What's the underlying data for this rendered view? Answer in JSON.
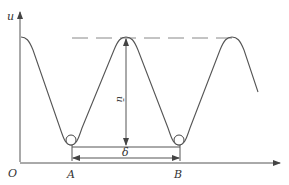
{
  "diagram": {
    "axes": {
      "y_label": "u",
      "origin_label": "O"
    },
    "points": {
      "a_label": "A",
      "b_label": "B"
    },
    "amplitude_label": "ū",
    "spacing_label": "δ",
    "colors": {
      "stroke": "#555555",
      "dash": "#888888",
      "text": "#333333"
    }
  }
}
